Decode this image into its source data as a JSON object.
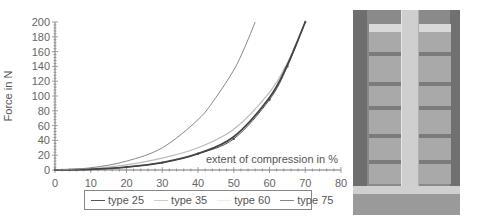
{
  "chart_data": {
    "type": "line",
    "title": "",
    "xlabel": "extent of compression in %",
    "ylabel": "Force in N",
    "xlim": [
      0,
      80
    ],
    "ylim": [
      0,
      200
    ],
    "xticks": [
      0,
      10,
      20,
      30,
      40,
      50,
      60,
      70,
      80
    ],
    "yticks": [
      0,
      20,
      40,
      60,
      80,
      100,
      120,
      140,
      160,
      180,
      200
    ],
    "grid": false,
    "legend_position": "bottom",
    "series": [
      {
        "name": "type 25",
        "color": "#555555",
        "x": [
          0,
          10,
          20,
          30,
          40,
          50,
          60,
          65,
          70
        ],
        "values": [
          0,
          1,
          4,
          10,
          22,
          42,
          95,
          140,
          200
        ]
      },
      {
        "name": "type 35",
        "color": "#bbbbbb",
        "x": [
          0,
          10,
          20,
          30,
          40,
          50,
          60,
          65,
          70
        ],
        "values": [
          0,
          2,
          7,
          16,
          30,
          55,
          105,
          145,
          200
        ]
      },
      {
        "name": "type 60",
        "color": "#444444",
        "x": [
          0,
          10,
          20,
          30,
          40,
          50,
          60,
          65,
          70
        ],
        "values": [
          0,
          1,
          4,
          10,
          22,
          45,
          98,
          142,
          200
        ]
      },
      {
        "name": "type 75",
        "color": "#888888",
        "x": [
          0,
          10,
          20,
          30,
          40,
          45,
          50,
          53,
          56
        ],
        "values": [
          0,
          3,
          12,
          30,
          68,
          98,
          135,
          165,
          200
        ]
      }
    ]
  },
  "legend": {
    "items": [
      {
        "label": "type 25"
      },
      {
        "label": "type 35"
      },
      {
        "label": "type 60"
      },
      {
        "label": "type 75"
      }
    ]
  },
  "photo": {
    "description": "photograph of compressed specimen between plates with measuring rod"
  }
}
